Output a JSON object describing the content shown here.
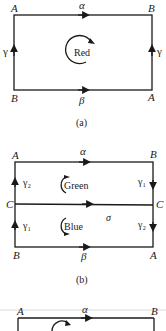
{
  "panels": [
    {
      "caption": "(a)",
      "corners": {
        "top_left": "A",
        "top_right": "B",
        "bottom_left": "B",
        "bottom_right": "A"
      },
      "edges": {
        "top": "α",
        "bottom": "β",
        "left": "γ",
        "right": "γ"
      },
      "region_label": "Red",
      "rotation": "clockwise"
    },
    {
      "caption": "(b)",
      "corners": {
        "top_left": "A",
        "top_right": "B",
        "mid_left": "C",
        "mid_right": "C",
        "bottom_left": "B",
        "bottom_right": "A"
      },
      "edges": {
        "top": "α",
        "middle": "σ",
        "bottom": "β",
        "left_upper": "γ₂",
        "left_lower": "γ₁",
        "right_upper": "γ₁",
        "right_lower": "γ₂"
      },
      "region_labels": {
        "upper": "Green",
        "lower": "Blue"
      },
      "middle_label": "σ"
    },
    {
      "caption": "",
      "corners": {
        "top_left": "A",
        "top_right": "B"
      },
      "edges": {
        "top": "α"
      }
    }
  ]
}
